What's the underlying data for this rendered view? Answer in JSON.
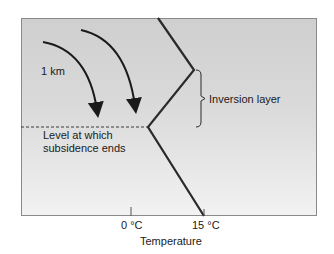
{
  "diagram": {
    "labels": {
      "altitude": "1 km",
      "inversion": "Inversion layer",
      "subsidence_line1": "Level at which",
      "subsidence_line2": "subsidence ends"
    },
    "axis": {
      "xlabel": "Temperature",
      "ticks": [
        "0 °C",
        "15 °C"
      ]
    },
    "colors": {
      "background_top": "#cfcfcf",
      "background_bottom": "#f2f2f2",
      "line": "#2a2a2a",
      "frame": "#8a8a8a"
    },
    "profile_points": [
      [
        158,
        18
      ],
      [
        194,
        70
      ],
      [
        148,
        127
      ],
      [
        204,
        216
      ]
    ],
    "inversion_layer": {
      "top_y": 70,
      "bottom_y": 127
    },
    "subsidence_arrows": 2
  }
}
